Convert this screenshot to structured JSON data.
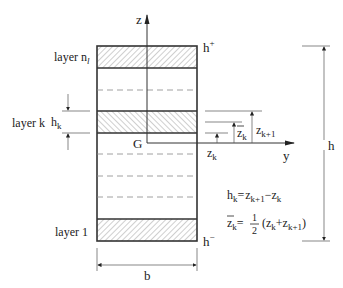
{
  "diagram": {
    "layers": [
      {
        "id": "top",
        "label": "layer n",
        "label_sub": "l",
        "hatch": "forward"
      },
      {
        "id": "middle",
        "label": "layer k",
        "hatch": "backward"
      },
      {
        "id": "bottom",
        "label": "layer 1",
        "hatch": "forward"
      }
    ],
    "axes": {
      "z": "z",
      "y": "y",
      "origin": "G"
    },
    "bounds": {
      "top": "h",
      "top_sup": "+",
      "bottom": "h",
      "bottom_sup": "−"
    },
    "dimensions": {
      "width": "b",
      "height": "h",
      "layer_thickness": "h",
      "layer_thickness_sub": "k",
      "z_k": "z",
      "z_k_sub": "k",
      "zbar_k": "z",
      "zbar_k_sub": "k",
      "z_k1": "z",
      "z_k1_sub": "k+1"
    },
    "formulas": {
      "f1_lhs": "h",
      "f1_lhs_sub": "k",
      "f1_eq": "=",
      "f1_t1": "z",
      "f1_t1_sub": "k+1",
      "f1_minus": "−",
      "f1_t2": "z",
      "f1_t2_sub": "k",
      "f2_lhs": "z",
      "f2_lhs_sub": "k",
      "f2_eq": "=",
      "f2_num": "1",
      "f2_den": "2",
      "f2_open": "(",
      "f2_t1": "z",
      "f2_t1_sub": "k",
      "f2_plus": "+",
      "f2_t2": "z",
      "f2_t2_sub": "k+1",
      "f2_close": ")"
    }
  }
}
